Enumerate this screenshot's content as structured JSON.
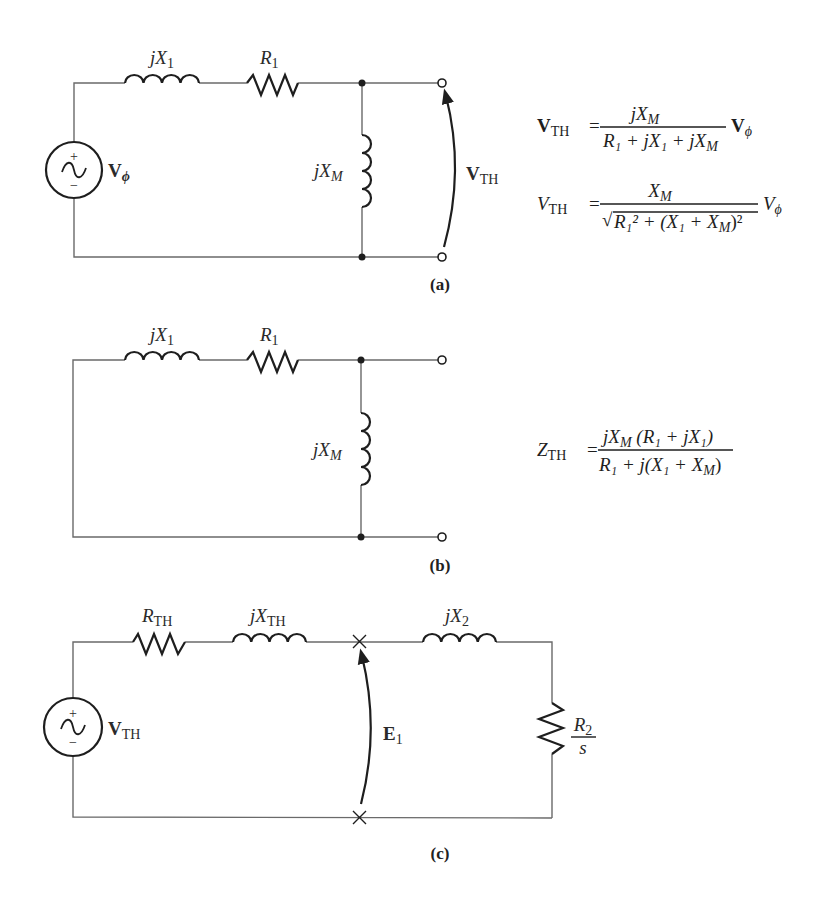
{
  "figure": {
    "panels": [
      {
        "id": "a",
        "caption": "(a)",
        "components": {
          "source_label_main": "V",
          "source_label_sub": "ϕ",
          "inductor_series_label": "jX",
          "inductor_series_sub": "1",
          "resistor_series_label": "R",
          "resistor_series_sub": "1",
          "inductor_shunt_label": "jX",
          "inductor_shunt_sub": "M",
          "output_voltage_main": "V",
          "output_voltage_sub": "TH"
        },
        "equations": [
          {
            "lhs_main": "V",
            "lhs_sub": "TH",
            "equals": "=",
            "numerator": "jX",
            "numerator_sub": "M",
            "denominator": "R₁ + jX₁ + jX",
            "denominator_sub": "M",
            "factor_main": "V",
            "factor_sub": "ϕ"
          },
          {
            "lhs_main": "V",
            "lhs_sub": "TH",
            "equals": "=",
            "numerator": "X",
            "numerator_sub": "M",
            "denominator_sqrt": "√",
            "denominator_body": "R₁² + (X₁ + X",
            "denominator_sub": "M",
            "denominator_tail": ")²",
            "factor_main": "V",
            "factor_sub": "ϕ"
          }
        ]
      },
      {
        "id": "b",
        "caption": "(b)",
        "components": {
          "inductor_series_label": "jX",
          "inductor_series_sub": "1",
          "resistor_series_label": "R",
          "resistor_series_sub": "1",
          "inductor_shunt_label": "jX",
          "inductor_shunt_sub": "M"
        },
        "equations": [
          {
            "lhs_main": "Z",
            "lhs_sub": "TH",
            "equals": "=",
            "numerator_a": "jX",
            "numerator_a_sub": "M",
            "numerator_b": "(R₁ + jX₁)",
            "denominator_a": "R₁ + j(X₁ + X",
            "denominator_sub": "M",
            "denominator_tail": ")"
          }
        ]
      },
      {
        "id": "c",
        "caption": "(c)",
        "components": {
          "source_label_main": "V",
          "source_label_sub": "TH",
          "resistor_th_label": "R",
          "resistor_th_sub": "TH",
          "inductor_th_label": "jX",
          "inductor_th_sub": "TH",
          "inductor_2_label": "jX",
          "inductor_2_sub": "2",
          "load_num": "R",
          "load_num_sub": "2",
          "load_den": "s",
          "emf_main": "E",
          "emf_sub": "1"
        }
      }
    ],
    "source_polarity": {
      "plus": "+",
      "minus": "−"
    }
  }
}
